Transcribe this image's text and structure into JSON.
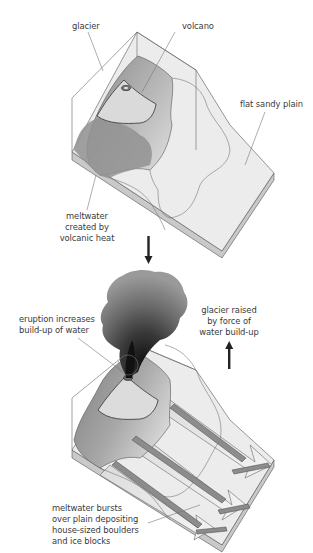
{
  "panel_top": {
    "labels": {
      "glacier": "glacier",
      "volcano": "volcano",
      "plain": "flat sandy plain",
      "meltwater": [
        "meltwater",
        "created by",
        "volcanic heat"
      ]
    }
  },
  "panel_bottom": {
    "labels": {
      "eruption": [
        "eruption increases",
        "build-up of water"
      ],
      "raised": [
        "glacier raised",
        "by force of",
        "water build-up"
      ],
      "bursts": [
        "meltwater bursts",
        "over plain depositing",
        "house-sized boulders",
        "and ice blocks"
      ]
    }
  },
  "arrows": {
    "sequence": "down-arrow-icon",
    "lift": "up-arrow-icon"
  },
  "colors": {
    "background": "#ffffff",
    "outline": "#555555",
    "plain_top": "#e9e9e9",
    "plain_side": "#c8c8c8",
    "glacier_light": "#c4c4c4",
    "glacier_dark": "#8f8f8f",
    "plume_dark": "#1e1e1e",
    "plume_light": "#8a8a8a",
    "text": "#3a3a3a"
  }
}
